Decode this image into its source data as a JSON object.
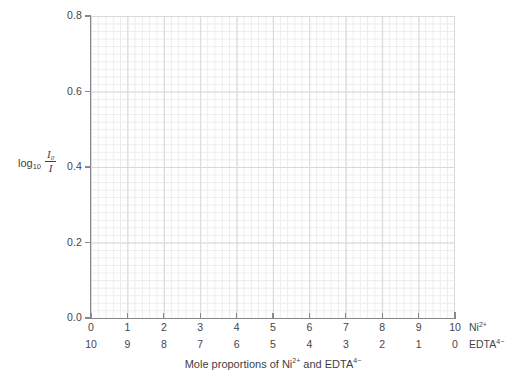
{
  "chart_data": {
    "type": "line",
    "title": "",
    "subtitle": "",
    "xlabel": "Mole proportions of Ni2+ and EDTA4-",
    "ylabel": "log10 (I0/I)",
    "xlim": [
      0,
      10
    ],
    "ylim": [
      0.0,
      0.8
    ],
    "grid": true,
    "grid_minor": true,
    "legend": "none",
    "series": [],
    "values": [],
    "x": [],
    "annotations": [],
    "note": "Empty grid / blank plot template for a Job's method of continuous variation experiment; no data points are plotted.",
    "y_ticks": [
      "0.8",
      "0.6",
      "0.4",
      "0.2",
      "0.0"
    ],
    "y_tick_values": [
      0.8,
      0.6,
      0.4,
      0.2,
      0.0
    ],
    "x_axis_rows": [
      {
        "species": "Ni",
        "charge": "2+",
        "ticks": [
          "0",
          "1",
          "2",
          "3",
          "4",
          "5",
          "6",
          "7",
          "8",
          "9",
          "10"
        ],
        "tick_values": [
          0,
          1,
          2,
          3,
          4,
          5,
          6,
          7,
          8,
          9,
          10
        ]
      },
      {
        "species": "EDTA",
        "charge": "4−",
        "ticks": [
          "10",
          "9",
          "8",
          "7",
          "6",
          "5",
          "4",
          "3",
          "2",
          "1",
          "0"
        ],
        "tick_values": [
          10,
          9,
          8,
          7,
          6,
          5,
          4,
          3,
          2,
          1,
          0
        ]
      }
    ]
  },
  "axis": {
    "y_title": {
      "log_text": "log",
      "log_base": "10",
      "numerator": "I",
      "numerator_sub": "0",
      "denominator": "I"
    },
    "x_title": {
      "prefix": "Mole proportions of ",
      "species_1": "Ni",
      "species_1_charge": "2+",
      "joiner": " and ",
      "species_2": "EDTA",
      "species_2_charge": "4−"
    },
    "row_labels": [
      {
        "name": "Ni",
        "charge": "2+"
      },
      {
        "name": "EDTA",
        "charge": "4−"
      }
    ]
  },
  "colors": {
    "axis": "#87878c",
    "grid_major": "#d8d8dc",
    "grid_minor": "#ececf0",
    "text": "#3f3f3f",
    "tick_text": "#454549",
    "background": "#ffffff"
  }
}
